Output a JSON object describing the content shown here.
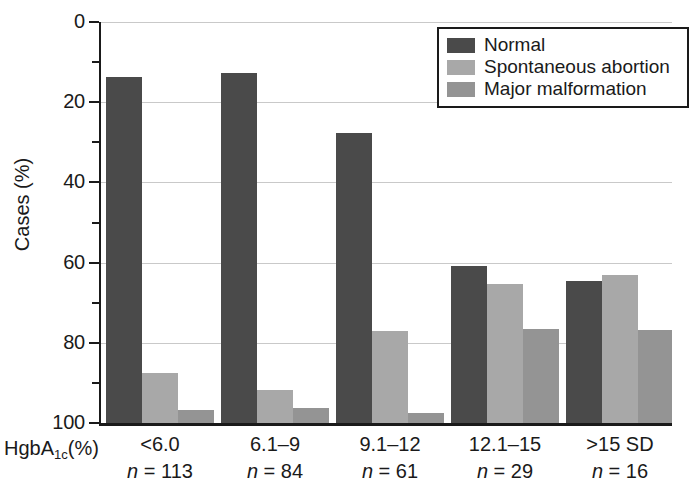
{
  "chart_data": {
    "type": "bar",
    "title": "",
    "xlabel": "HgbA1c(%)",
    "ylabel": "Cases (%)",
    "ylim": [
      0,
      100
    ],
    "ytick_major": [
      0,
      20,
      40,
      60,
      80,
      100
    ],
    "ytick_minor": [
      10,
      30,
      50,
      70,
      90
    ],
    "grid": "horizontal major gridlines only",
    "legend_position": "top-right inside plot",
    "categories": [
      "<6.0",
      "6.1–9",
      "9.1–12",
      "12.1–15",
      ">15 SD"
    ],
    "category_counts": [
      "n = 113",
      "n = 84",
      "n = 61",
      "n = 29",
      "n = 16"
    ],
    "series": [
      {
        "name": "Normal",
        "color": "#4a4a4a",
        "values": [
          86.2,
          87.4,
          72.4,
          39.2,
          35.4
        ]
      },
      {
        "name": "Spontaneous abortion",
        "color": "#a8a8a8",
        "values": [
          12.4,
          8.2,
          23.0,
          34.6,
          37.0
        ]
      },
      {
        "name": "Major malformation",
        "color": "#949494",
        "values": [
          3.2,
          3.8,
          2.4,
          23.4,
          23.2
        ]
      }
    ]
  },
  "axes": {
    "y_title": "Cases (%)",
    "y_tick_labels": [
      "100",
      "80",
      "60",
      "40",
      "20",
      "0"
    ],
    "x_title_main": "HgbA",
    "x_title_sub": "1c",
    "x_title_tail": "(%)"
  },
  "legend": {
    "items": [
      {
        "label": "Normal",
        "color": "#4a4a4a"
      },
      {
        "label": "Spontaneous abortion",
        "color": "#a8a8a8"
      },
      {
        "label": "Major malformation",
        "color": "#949494"
      }
    ]
  },
  "groups": [
    {
      "range": "<6.0",
      "n": "n = 113"
    },
    {
      "range": "6.1–9",
      "n": "n = 84"
    },
    {
      "range": "9.1–12",
      "n": "n = 61"
    },
    {
      "range": "12.1–15",
      "n": "n = 29"
    },
    {
      "range": ">15 SD",
      "n": "n = 16"
    }
  ]
}
